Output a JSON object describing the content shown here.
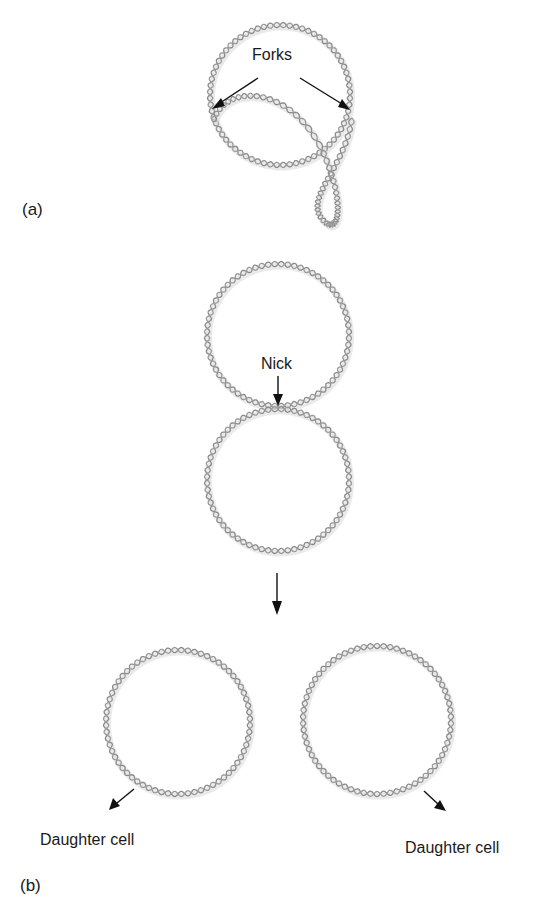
{
  "figure": {
    "panel_a": {
      "label": "(a)",
      "annotation": "Forks",
      "description": "Circular DNA mid-replication with two replication forks and a replicated loop"
    },
    "panel_b": {
      "label": "(b)",
      "annotation_nick": "Nick",
      "daughter_left": "Daughter cell",
      "daughter_right": "Daughter cell",
      "description": "Two interlocked/touching daughter circles separate after a nick, each going to a daughter cell"
    }
  },
  "colors": {
    "strand": "#8a8a8a",
    "strand_light": "#9a9a9a",
    "shadow": "#d9d9d9",
    "arrow": "#111111",
    "text": "#1a1a1a",
    "background": "#ffffff"
  },
  "icons": {
    "dna-helix": "double-helix strand drawn as two sinusoidal paths along a circle",
    "arrow": "straight line with filled triangular head"
  }
}
